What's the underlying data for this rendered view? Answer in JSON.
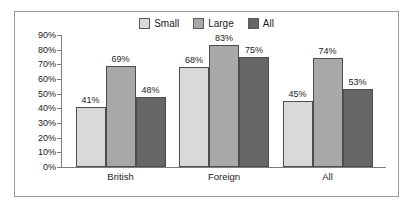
{
  "chart_data": {
    "type": "bar",
    "title": "",
    "xlabel": "",
    "ylabel": "",
    "categories": [
      "British",
      "Foreign",
      "All"
    ],
    "series": [
      {
        "name": "Small",
        "values": [
          41,
          69,
          48
        ],
        "color": "#d9d9d9"
      },
      {
        "name": "Large",
        "values": [
          83,
          83,
          74
        ],
        "color": "#a8a8a8"
      },
      {
        "name": "All",
        "values": [
          48,
          75,
          53
        ],
        "color": "#666666"
      }
    ],
    "data_labels": [
      [
        "41%",
        "69%",
        "48%"
      ],
      [
        "68%",
        "83%",
        "75%"
      ],
      [
        "45%",
        "74%",
        "53%"
      ]
    ],
    "ylim": [
      0,
      90
    ],
    "ytick_step": 10,
    "ytick_labels": [
      "90%",
      "80%",
      "70%",
      "60%",
      "50%",
      "40%",
      "30%",
      "20%",
      "10%",
      "0%"
    ],
    "ytick_values": [
      90,
      80,
      70,
      60,
      50,
      40,
      30,
      20,
      10,
      0
    ],
    "grid": false,
    "legend_position": "top-center",
    "groups": [
      {
        "category": "British",
        "bars": [
          {
            "series": "Small",
            "value": 41,
            "label": "41%"
          },
          {
            "series": "Large",
            "value": 69,
            "label": "69%"
          },
          {
            "series": "All",
            "value": 48,
            "label": "48%"
          }
        ]
      },
      {
        "category": "Foreign",
        "bars": [
          {
            "series": "Small",
            "value": 68,
            "label": "68%"
          },
          {
            "series": "Large",
            "value": 83,
            "label": "83%"
          },
          {
            "series": "All",
            "value": 75,
            "label": "75%"
          }
        ]
      },
      {
        "category": "All",
        "bars": [
          {
            "series": "Small",
            "value": 45,
            "label": "45%"
          },
          {
            "series": "Large",
            "value": 74,
            "label": "74%"
          },
          {
            "series": "All",
            "value": 53,
            "label": "53%"
          }
        ]
      }
    ]
  },
  "legend": {
    "items": [
      {
        "label": "Small",
        "color": "#d9d9d9"
      },
      {
        "label": "Large",
        "color": "#a8a8a8"
      },
      {
        "label": "All",
        "color": "#666666"
      }
    ]
  },
  "colors": {
    "small": "#d9d9d9",
    "large": "#a8a8a8",
    "all": "#666666",
    "bar_border": "#4d4d4d",
    "axis": "#7d7d7d",
    "frame_border": "#9b9b9b",
    "background": "#ffffff",
    "text": "#1a1a1a"
  }
}
